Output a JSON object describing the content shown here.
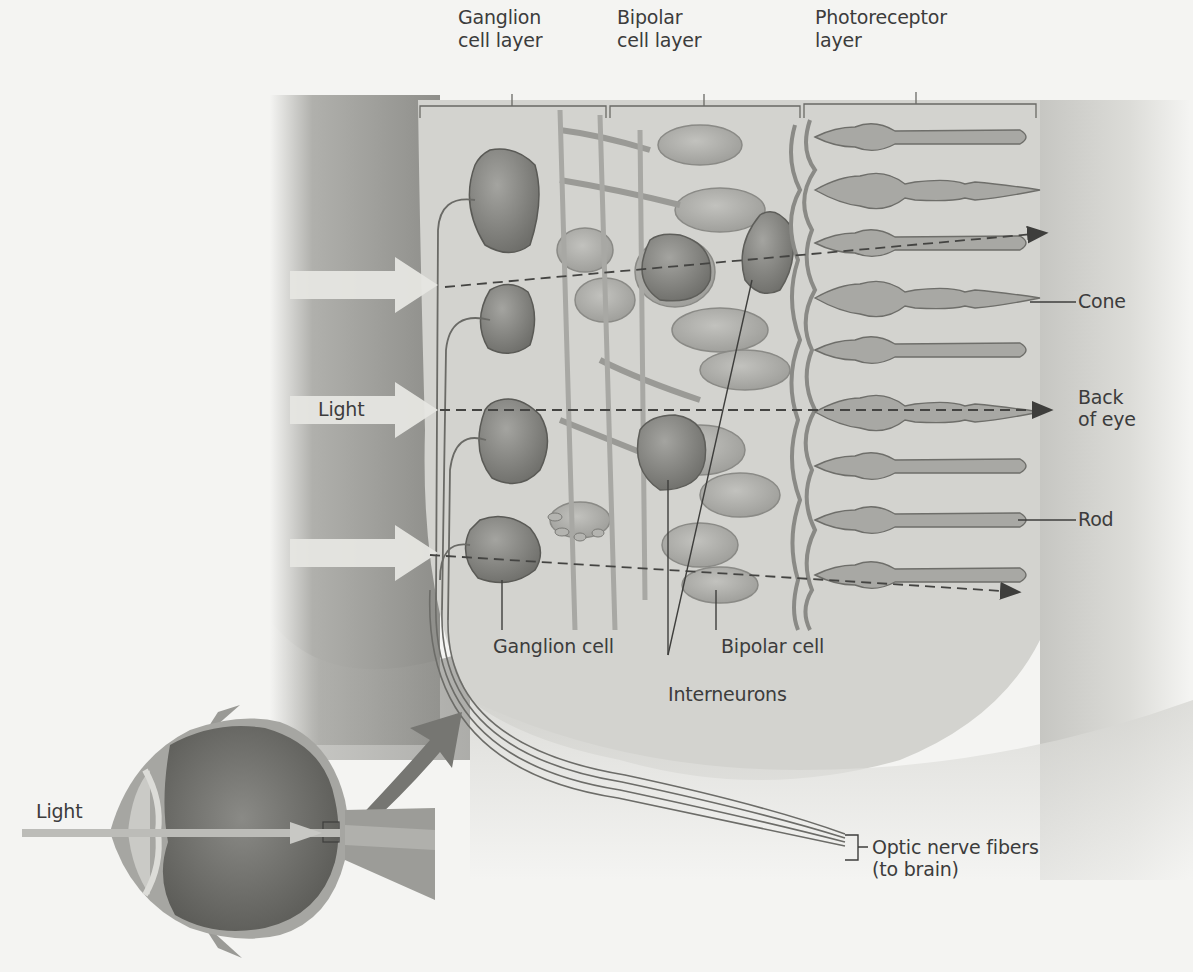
{
  "figure": {
    "colors": {
      "background": "#f4f4f2",
      "slab": "#d2d2ce",
      "shadow": "#8c8c88",
      "cell_body": "#7e7e7a",
      "cell_light": "#bdbdb8",
      "outline": "#5e5e5a",
      "text": "#3c3c3c",
      "arrow_dark": "#4a4a48"
    }
  },
  "layer_labels": [
    {
      "id": "ganglion",
      "label": "Ganglion\ncell layer"
    },
    {
      "id": "bipolar",
      "label": "Bipolar\ncell layer"
    },
    {
      "id": "photoreceptor",
      "label": "Photoreceptor\nlayer"
    }
  ],
  "callouts": {
    "cone": "Cone",
    "back_of_eye": "Back\nof eye",
    "rod": "Rod",
    "light_main": "Light",
    "ganglion_cell": "Ganglion cell",
    "bipolar_cell": "Bipolar cell",
    "interneurons": "Interneurons",
    "optic_nerve": "Optic nerve fibers\n(to brain)",
    "light_eye": "Light"
  },
  "light_arrows": [
    {
      "y": 285
    },
    {
      "y": 410
    },
    {
      "y": 553
    }
  ],
  "photoreceptors": [
    {
      "type": "rod",
      "y": 137
    },
    {
      "type": "cone",
      "y": 190
    },
    {
      "type": "rod",
      "y": 243
    },
    {
      "type": "cone",
      "y": 298
    },
    {
      "type": "rod",
      "y": 350
    },
    {
      "type": "cone",
      "y": 412
    },
    {
      "type": "rod",
      "y": 466
    },
    {
      "type": "rod",
      "y": 520
    },
    {
      "type": "rod",
      "y": 575
    }
  ]
}
